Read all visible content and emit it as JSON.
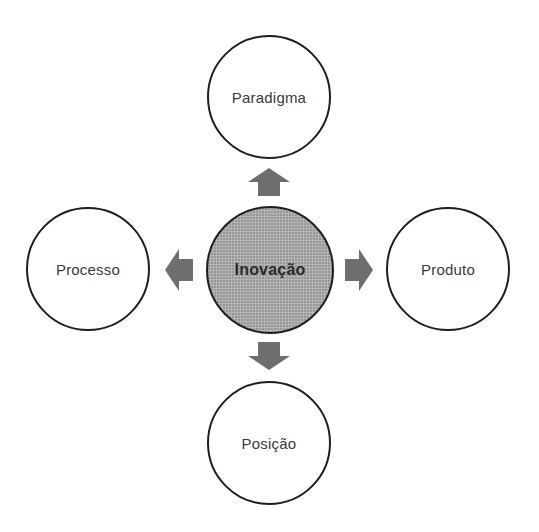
{
  "diagram": {
    "type": "radial-concept-map",
    "center": {
      "label": "Inovação",
      "fill": "#b5b5b5"
    },
    "nodes": {
      "top": {
        "label": "Paradigma"
      },
      "left": {
        "label": "Processo"
      },
      "right": {
        "label": "Produto"
      },
      "bottom": {
        "label": "Posição"
      }
    },
    "arrow_color": "#6e6e6e",
    "node_border_color": "#1e1e1e"
  }
}
